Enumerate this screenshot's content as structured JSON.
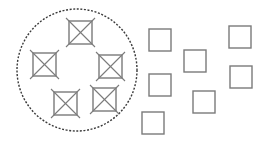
{
  "diagram": {
    "colors": {
      "background": "#ffffff",
      "stroke": "#7a7a7a",
      "dashed_boundary": "#3a3a3a"
    },
    "boundary": {
      "shape": "ellipse",
      "style": "dashed",
      "cx": 77,
      "cy": 70,
      "rx": 60,
      "ry": 61
    },
    "crossed_squares": [
      {
        "x": 69,
        "y": 21,
        "size": 23
      },
      {
        "x": 33,
        "y": 53,
        "size": 23
      },
      {
        "x": 99,
        "y": 55,
        "size": 23
      },
      {
        "x": 54,
        "y": 92,
        "size": 23
      },
      {
        "x": 93,
        "y": 88,
        "size": 23
      }
    ],
    "plain_squares": [
      {
        "x": 149,
        "y": 29,
        "size": 22
      },
      {
        "x": 184,
        "y": 50,
        "size": 22
      },
      {
        "x": 229,
        "y": 26,
        "size": 22
      },
      {
        "x": 149,
        "y": 74,
        "size": 22
      },
      {
        "x": 230,
        "y": 66,
        "size": 22
      },
      {
        "x": 193,
        "y": 91,
        "size": 22
      },
      {
        "x": 142,
        "y": 112,
        "size": 22
      }
    ]
  }
}
